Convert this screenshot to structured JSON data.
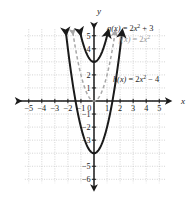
{
  "figure": {
    "name": "parabola-transformations-graph",
    "axis_labels": {
      "x": "x",
      "y": "y"
    },
    "colors": {
      "solid_curve": "#1a1a1a",
      "dashed_curve": "#a8a8a8",
      "axis": "#1a1a1a",
      "grid": "#c9c9c9",
      "background": "#ffffff"
    }
  },
  "chart_data": {
    "type": "line",
    "title": "",
    "xlabel": "x",
    "ylabel": "y",
    "xlim": [
      -5.6,
      5.6
    ],
    "ylim": [
      -6.4,
      5.6
    ],
    "xticks": [
      -5,
      -4,
      -3,
      -2,
      -1,
      0,
      1,
      2,
      3,
      4,
      5
    ],
    "xtick_labels": [
      "-5",
      "-4",
      "-3",
      "-2",
      "-1",
      "0",
      "1",
      "2",
      "3",
      "4",
      "5"
    ],
    "yticks": [
      5,
      4,
      2,
      1,
      -1,
      -2,
      -3,
      -5,
      -6
    ],
    "ytick_labels": [
      "5",
      "4",
      "2",
      "1",
      "-1",
      "-2",
      "-3",
      "-5",
      "-6"
    ],
    "grid": true,
    "grid_style": "dotted",
    "legend": "inline-annotations",
    "series": [
      {
        "name": "f",
        "label": "f(x) = 2x²",
        "equation_parts": {
          "fn": "f(x)",
          "eq": "=",
          "coef": "2",
          "var": "x",
          "exp": "2",
          "const": ""
        },
        "style": "dashed",
        "color": "#a8a8a8",
        "vertex": [
          0,
          0
        ],
        "a": 2,
        "k": 0,
        "arrows": "both-ends-up",
        "points": [
          [
            -1.6,
            5.12
          ],
          [
            -1.5,
            4.5
          ],
          [
            -1,
            2
          ],
          [
            -0.5,
            0.5
          ],
          [
            0,
            0
          ],
          [
            0.5,
            0.5
          ],
          [
            1,
            2
          ],
          [
            1.5,
            4.5
          ],
          [
            1.6,
            5.12
          ]
        ]
      },
      {
        "name": "g",
        "label": "g(x) = 2x² + 3",
        "equation_parts": {
          "fn": "g(x)",
          "eq": "=",
          "coef": "2",
          "var": "x",
          "exp": "2",
          "const": "+ 3"
        },
        "style": "solid",
        "color": "#1a1a1a",
        "vertex": [
          0,
          3
        ],
        "a": 2,
        "k": 3,
        "arrows": "both-ends-up",
        "points": [
          [
            -1.05,
            5.2
          ],
          [
            -1,
            5
          ],
          [
            -0.75,
            4.125
          ],
          [
            -0.5,
            3.5
          ],
          [
            -0.25,
            3.125
          ],
          [
            0,
            3
          ],
          [
            0.25,
            3.125
          ],
          [
            0.5,
            3.5
          ],
          [
            0.75,
            4.125
          ],
          [
            1,
            5
          ],
          [
            1.05,
            5.2
          ]
        ]
      },
      {
        "name": "h",
        "label": "h(x) = 2x² − 4",
        "equation_parts": {
          "fn": "h(x)",
          "eq": "=",
          "coef": "2",
          "var": "x",
          "exp": "2",
          "const": "− 4"
        },
        "style": "solid",
        "color": "#1a1a1a",
        "vertex": [
          0,
          -4
        ],
        "a": 2,
        "k": -4,
        "arrows": "both-ends-up",
        "points": [
          [
            -1.8,
            2.48
          ],
          [
            -1.5,
            0.5
          ],
          [
            -1.25,
            -0.875
          ],
          [
            -1,
            -2
          ],
          [
            -0.75,
            -2.875
          ],
          [
            -0.5,
            -3.5
          ],
          [
            -0.25,
            -3.875
          ],
          [
            0,
            -4
          ],
          [
            0.25,
            -3.875
          ],
          [
            0.5,
            -3.5
          ],
          [
            0.75,
            -2.875
          ],
          [
            1,
            -2
          ],
          [
            1.25,
            -0.875
          ],
          [
            1.5,
            0.5
          ],
          [
            1.8,
            2.48
          ]
        ]
      }
    ],
    "annotations": [
      {
        "id": "ann-g",
        "text": "g(x) = 2x² + 3",
        "x": 1.0,
        "y": 5.4,
        "color": "#1d1d1d"
      },
      {
        "id": "ann-f",
        "text": "f(x) = 2x²",
        "x": 1.9,
        "y": 4.55,
        "color": "#9a9a9a"
      },
      {
        "id": "ann-h",
        "text": "h(x) = 2x² − 4",
        "x": 1.45,
        "y": 1.45,
        "color": "#1d1d1d"
      }
    ]
  }
}
